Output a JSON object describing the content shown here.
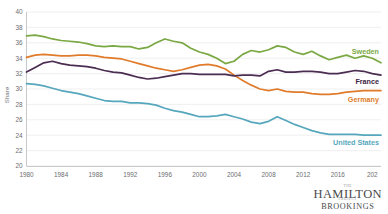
{
  "chart_data": {
    "type": "line",
    "title": "",
    "xlabel": "",
    "ylabel": "Share",
    "xlim": [
      1980,
      2021
    ],
    "ylim": [
      20,
      40
    ],
    "ytick_step": 2,
    "grid": true,
    "legend": "inline-end-of-line",
    "x": [
      1980,
      1981,
      1982,
      1983,
      1984,
      1985,
      1986,
      1987,
      1988,
      1989,
      1990,
      1991,
      1992,
      1993,
      1994,
      1995,
      1996,
      1997,
      1998,
      1999,
      2000,
      2001,
      2002,
      2003,
      2004,
      2005,
      2006,
      2007,
      2008,
      2009,
      2010,
      2011,
      2012,
      2013,
      2014,
      2015,
      2016,
      2017,
      2018,
      2019,
      2020,
      2021
    ],
    "yticks": [
      20,
      22,
      24,
      26,
      28,
      30,
      32,
      34,
      36,
      38,
      40
    ],
    "xticks": [
      1980,
      1984,
      1988,
      1992,
      1996,
      2000,
      2004,
      2008,
      2012,
      2016,
      2020
    ],
    "xtick_labels": [
      "1980",
      "1984",
      "1988",
      "1992",
      "1996",
      "2000",
      "2004",
      "2008",
      "2012",
      "2016",
      "202"
    ],
    "ytick_labels": [
      "20",
      "22",
      "24",
      "26",
      "28",
      "30",
      "32",
      "34",
      "36",
      "38",
      "40"
    ],
    "series": [
      {
        "name": "Sweden",
        "color": "#7aa843",
        "label_color": "#7aa843",
        "values": [
          36.9,
          37.0,
          36.8,
          36.5,
          36.3,
          36.2,
          36.1,
          35.9,
          35.6,
          35.5,
          35.6,
          35.5,
          35.5,
          35.2,
          35.4,
          36.0,
          36.5,
          36.2,
          36.0,
          35.3,
          34.8,
          34.5,
          34.0,
          33.3,
          33.6,
          34.5,
          35.0,
          34.8,
          35.1,
          35.6,
          35.4,
          34.8,
          34.5,
          34.9,
          34.3,
          33.8,
          34.1,
          34.4,
          34.0,
          34.3,
          34.0,
          33.4
        ]
      },
      {
        "name": "Germany",
        "color": "#e07b2b",
        "label_color": "#e07b2b",
        "values": [
          34.1,
          34.4,
          34.5,
          34.4,
          34.3,
          34.3,
          34.4,
          34.4,
          34.3,
          34.1,
          34.0,
          33.9,
          33.6,
          33.3,
          33.0,
          32.7,
          32.5,
          32.3,
          32.5,
          32.8,
          33.1,
          33.2,
          33.0,
          32.6,
          31.8,
          31.1,
          30.5,
          30.0,
          29.8,
          30.0,
          29.7,
          29.6,
          29.6,
          29.4,
          29.3,
          29.3,
          29.4,
          29.6,
          29.7,
          29.8,
          29.8,
          29.8
        ]
      },
      {
        "name": "France",
        "color": "#4b2d52",
        "label_color": "#3b2340",
        "values": [
          32.2,
          32.8,
          33.4,
          33.6,
          33.3,
          33.1,
          33.0,
          32.9,
          32.7,
          32.4,
          32.2,
          32.1,
          31.8,
          31.5,
          31.3,
          31.4,
          31.6,
          31.8,
          32.0,
          32.0,
          31.9,
          31.9,
          31.9,
          31.9,
          31.7,
          31.8,
          31.8,
          31.7,
          32.3,
          32.5,
          32.2,
          32.2,
          32.3,
          32.3,
          32.2,
          32.0,
          32.0,
          32.2,
          32.4,
          32.3,
          32.0,
          31.8
        ]
      },
      {
        "name": "United States",
        "color": "#56a7bd",
        "label_color": "#56a7bd",
        "values": [
          30.7,
          30.6,
          30.4,
          30.1,
          29.8,
          29.6,
          29.4,
          29.1,
          28.8,
          28.5,
          28.4,
          28.4,
          28.2,
          28.2,
          28.1,
          27.9,
          27.5,
          27.2,
          27.0,
          26.7,
          26.4,
          26.4,
          26.5,
          26.7,
          26.4,
          26.1,
          25.7,
          25.5,
          25.8,
          26.4,
          25.9,
          25.4,
          25.0,
          24.6,
          24.3,
          24.1,
          24.1,
          24.1,
          24.1,
          24.0,
          24.0,
          24.0
        ]
      }
    ]
  },
  "logo": {
    "the": "THE",
    "hamilton": "HAMILTON",
    "project": "PROJECT",
    "brookings": "BROOKINGS"
  }
}
